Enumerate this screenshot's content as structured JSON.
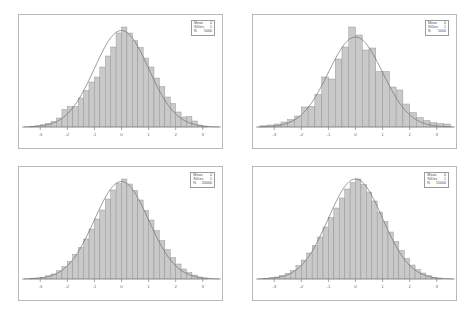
{
  "figure": {
    "background_color": "#ffffff",
    "frame_color": "#b9b9b9",
    "bar_fill_color": "#c9c9c9",
    "bar_edge_color": "#8a8a8a",
    "curve_color": "#6e6e6e",
    "axis_color": "#808080",
    "text_color": "#4d4d4d",
    "layout": "2x2 grid of histograms with normal curve overlay"
  },
  "legend_labels": {
    "mean": "Mean",
    "stdev": "StDev",
    "n": "N"
  },
  "chart_data": [
    {
      "type": "bar",
      "title": "",
      "panel": "top-left",
      "xlabel": "",
      "ylabel": "",
      "xlim": [
        -3.6,
        3.6
      ],
      "ylim": [
        0,
        1.08
      ],
      "grid": false,
      "legend_position": "top-right",
      "stats": {
        "mean": "0",
        "stdev": "1",
        "n": "5000"
      },
      "xticks": [
        -3,
        -2,
        -1,
        0,
        1,
        2,
        3
      ],
      "xticklabels": [
        "-3",
        "-2",
        "-1",
        "0",
        "1",
        "2",
        "3"
      ],
      "bin_width": 0.2,
      "categories": [
        -3.3,
        -3.1,
        -2.9,
        -2.7,
        -2.5,
        -2.3,
        -2.1,
        -1.9,
        -1.7,
        -1.5,
        -1.3,
        -1.1,
        -0.9,
        -0.7,
        -0.5,
        -0.3,
        -0.1,
        0.1,
        0.3,
        0.5,
        0.7,
        0.9,
        1.1,
        1.3,
        1.5,
        1.7,
        1.9,
        2.1,
        2.3,
        2.5,
        2.7,
        2.9,
        3.1
      ],
      "values": [
        0.006,
        0.012,
        0.022,
        0.036,
        0.055,
        0.09,
        0.175,
        0.205,
        0.205,
        0.29,
        0.365,
        0.45,
        0.5,
        0.6,
        0.71,
        0.8,
        0.94,
        1.0,
        0.94,
        0.865,
        0.795,
        0.69,
        0.6,
        0.49,
        0.405,
        0.3,
        0.235,
        0.15,
        0.1,
        0.105,
        0.06,
        0.02,
        0.008
      ],
      "curve": {
        "name": "normal",
        "mean": 0,
        "stdev": 1,
        "peak": 0.965
      }
    },
    {
      "type": "bar",
      "title": "",
      "panel": "top-right",
      "xlabel": "",
      "ylabel": "",
      "xlim": [
        -3.6,
        3.6
      ],
      "ylim": [
        0,
        1.08
      ],
      "grid": false,
      "legend_position": "top-right",
      "stats": {
        "mean": "0",
        "stdev": "1",
        "n": "5000"
      },
      "xticks": [
        -3,
        -2,
        -1,
        0,
        1,
        2,
        3
      ],
      "xticklabels": [
        "-3",
        "-2",
        "-1",
        "0",
        "1",
        "2",
        "3"
      ],
      "bin_width": 0.25,
      "categories": [
        -3.375,
        -3.125,
        -2.875,
        -2.625,
        -2.375,
        -2.125,
        -1.875,
        -1.625,
        -1.375,
        -1.125,
        -0.875,
        -0.625,
        -0.375,
        -0.125,
        0.125,
        0.375,
        0.625,
        0.875,
        1.125,
        1.375,
        1.625,
        1.875,
        2.125,
        2.375,
        2.625,
        2.875,
        3.125,
        3.375
      ],
      "values": [
        0.012,
        0.02,
        0.03,
        0.05,
        0.075,
        0.11,
        0.2,
        0.205,
        0.325,
        0.5,
        0.48,
        0.68,
        0.8,
        1.0,
        0.92,
        0.77,
        0.79,
        0.555,
        0.555,
        0.4,
        0.37,
        0.23,
        0.145,
        0.095,
        0.065,
        0.045,
        0.035,
        0.03
      ],
      "curve": {
        "name": "normal",
        "mean": 0,
        "stdev": 1,
        "peak": 0.9
      }
    },
    {
      "type": "bar",
      "title": "",
      "panel": "bottom-left",
      "xlabel": "",
      "ylabel": "",
      "xlim": [
        -3.6,
        3.6
      ],
      "ylim": [
        0,
        1.08
      ],
      "grid": false,
      "legend_position": "top-right",
      "stats": {
        "mean": "0",
        "stdev": "1",
        "n": "20000"
      },
      "xticks": [
        -3,
        -2,
        -1,
        0,
        1,
        2,
        3
      ],
      "xticklabels": [
        "-3",
        "-2",
        "-1",
        "0",
        "1",
        "2",
        "3"
      ],
      "bin_width": 0.2,
      "categories": [
        -3.3,
        -3.1,
        -2.9,
        -2.7,
        -2.5,
        -2.3,
        -2.1,
        -1.9,
        -1.7,
        -1.5,
        -1.3,
        -1.1,
        -0.9,
        -0.7,
        -0.5,
        -0.3,
        -0.1,
        0.1,
        0.3,
        0.5,
        0.7,
        0.9,
        1.1,
        1.3,
        1.5,
        1.7,
        1.9,
        2.1,
        2.3,
        2.5,
        2.7,
        2.9,
        3.1
      ],
      "values": [
        0.005,
        0.01,
        0.018,
        0.032,
        0.05,
        0.082,
        0.125,
        0.175,
        0.245,
        0.315,
        0.4,
        0.5,
        0.6,
        0.69,
        0.8,
        0.89,
        0.955,
        1.0,
        0.95,
        0.885,
        0.79,
        0.685,
        0.59,
        0.485,
        0.385,
        0.295,
        0.215,
        0.15,
        0.1,
        0.065,
        0.04,
        0.02,
        0.01
      ],
      "curve": {
        "name": "normal",
        "mean": 0,
        "stdev": 1,
        "peak": 0.975
      }
    },
    {
      "type": "bar",
      "title": "",
      "panel": "bottom-right",
      "xlabel": "",
      "ylabel": "",
      "xlim": [
        -3.6,
        3.6
      ],
      "ylim": [
        0,
        1.08
      ],
      "grid": false,
      "legend_position": "top-right",
      "stats": {
        "mean": "0",
        "stdev": "1",
        "n": "15000"
      },
      "xticks": [
        -3,
        -2,
        -1,
        0,
        1,
        2,
        3
      ],
      "xticklabels": [
        "-3",
        "-2",
        "-1",
        "0",
        "1",
        "2",
        "3"
      ],
      "bin_width": 0.2,
      "categories": [
        -3.3,
        -3.1,
        -2.9,
        -2.7,
        -2.5,
        -2.3,
        -2.1,
        -1.9,
        -1.7,
        -1.5,
        -1.3,
        -1.1,
        -0.9,
        -0.7,
        -0.5,
        -0.3,
        -0.1,
        0.1,
        0.3,
        0.5,
        0.7,
        0.9,
        1.1,
        1.3,
        1.5,
        1.7,
        1.9,
        2.1,
        2.3,
        2.5,
        2.7,
        2.9,
        3.1
      ],
      "values": [
        0.006,
        0.012,
        0.02,
        0.035,
        0.055,
        0.085,
        0.135,
        0.19,
        0.26,
        0.335,
        0.42,
        0.52,
        0.615,
        0.71,
        0.81,
        0.9,
        0.965,
        1.0,
        0.945,
        0.87,
        0.78,
        0.67,
        0.575,
        0.47,
        0.375,
        0.285,
        0.205,
        0.14,
        0.095,
        0.06,
        0.035,
        0.018,
        0.008
      ]
    }
  ]
}
